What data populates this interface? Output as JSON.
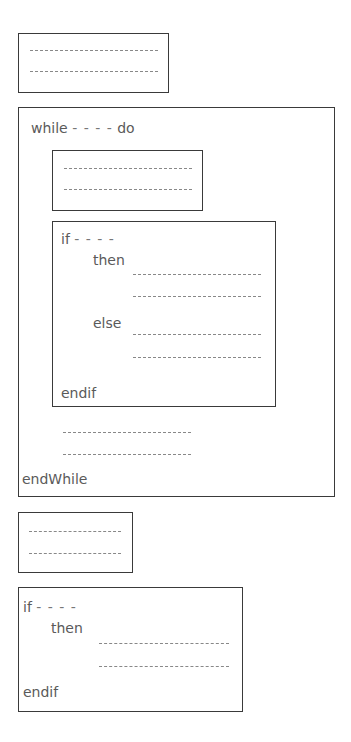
{
  "diagram": {
    "type": "pseudocode-structure",
    "stroke_color": "#3a3a3a",
    "text_color": "#5a5a5a",
    "placeholder": "- - - -",
    "blocks": [
      {
        "id": "seq1",
        "kind": "sequence",
        "lines": 2
      },
      {
        "id": "while1",
        "kind": "while",
        "header_keyword": "while",
        "condition": "- - - -",
        "do_keyword": "do",
        "footer_keyword": "endWhile",
        "children": [
          {
            "id": "seq2",
            "kind": "sequence",
            "lines": 2
          },
          {
            "id": "if1",
            "kind": "if-then-else",
            "if_keyword": "if",
            "condition": "- - - -",
            "then_keyword": "then",
            "then_lines": 2,
            "else_keyword": "else",
            "else_lines": 2,
            "footer_keyword": "endif"
          },
          {
            "id": "seq3",
            "kind": "plain-lines",
            "lines": 2
          }
        ]
      },
      {
        "id": "seq4",
        "kind": "sequence",
        "lines": 2
      },
      {
        "id": "if2",
        "kind": "if-then",
        "if_keyword": "if",
        "condition": "- - - -",
        "then_keyword": "then",
        "then_lines": 2,
        "footer_keyword": "endif"
      }
    ]
  }
}
